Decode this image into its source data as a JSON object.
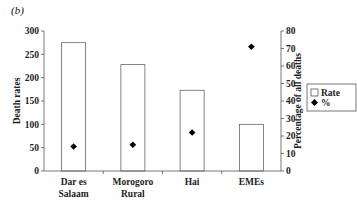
{
  "panel_label": "(b)",
  "chart_data": {
    "type": "bar",
    "title": "",
    "panel": "(b)",
    "categories": [
      "Dar es Salaam",
      "Morogoro Rural",
      "Hai",
      "EMEs"
    ],
    "category_lines": [
      [
        "Dar es",
        "Salaam"
      ],
      [
        "Morogoro",
        "Rural"
      ],
      [
        "Hai"
      ],
      [
        "EMEs"
      ]
    ],
    "series": [
      {
        "name": "Rate",
        "type": "bar",
        "axis": "left",
        "values": [
          275,
          228,
          173,
          100
        ],
        "color": "#ffffff",
        "stroke": "#666666"
      },
      {
        "name": "%",
        "type": "scatter",
        "marker": "diamond",
        "axis": "right",
        "values": [
          14,
          15,
          22,
          71
        ],
        "color": "#000000"
      }
    ],
    "xlabel": "",
    "ylabel": "Death rates",
    "ylabel_right": "Percentage of all deaths",
    "ylim": [
      0,
      300
    ],
    "ylim_right": [
      0,
      80
    ],
    "yticks": [
      0,
      50,
      100,
      150,
      200,
      250,
      300
    ],
    "yticks_right": [
      0,
      10,
      20,
      30,
      40,
      50,
      60,
      70,
      80
    ],
    "grid": false,
    "legend": {
      "position": "right",
      "entries": [
        "Rate",
        "%"
      ]
    }
  }
}
